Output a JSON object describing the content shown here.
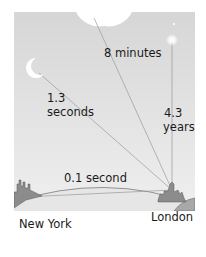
{
  "diagram": {
    "title": "",
    "labels": {
      "sun_time": "8 minutes",
      "moon_time_value": "1.3",
      "moon_time_unit": "seconds",
      "star_time_value": "4.3",
      "star_time_unit": "years",
      "earth_time": "0.1 second"
    },
    "places": {
      "origin": "New York",
      "destination": "London"
    },
    "objects": [
      "sun",
      "moon",
      "star",
      "earth"
    ],
    "colors": {
      "sky_top": "#d8d8d8",
      "sky_bottom": "#ececec",
      "line": "#9a9a9a",
      "ground": "#e4e4e4",
      "city": "#8a8a8a",
      "celestial": "#ffffff"
    }
  }
}
